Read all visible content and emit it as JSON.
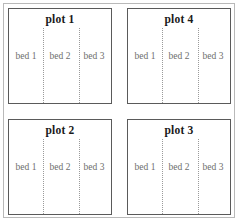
{
  "diagram": {
    "type": "garden-plot-layout",
    "grid": {
      "rows": 2,
      "columns": 2
    },
    "plots": [
      {
        "id": "plot-1",
        "position": "top-left",
        "title": "plot 1",
        "beds": [
          "bed 1",
          "bed 2",
          "bed 3"
        ]
      },
      {
        "id": "plot-4",
        "position": "top-right",
        "title": "plot 4",
        "beds": [
          "bed 1",
          "bed 2",
          "bed 3"
        ]
      },
      {
        "id": "plot-2",
        "position": "bottom-left",
        "title": "plot 2",
        "beds": [
          "bed 1",
          "bed 2",
          "bed 3"
        ]
      },
      {
        "id": "plot-3",
        "position": "bottom-right",
        "title": "plot 3",
        "beds": [
          "bed 1",
          "bed 2",
          "bed 3"
        ]
      }
    ],
    "colors": {
      "outer_frame": "#b9b9b9",
      "plot_border": "#5a5a5a",
      "divider": "#9a9a9a",
      "title_text": "#1a1a1a",
      "bed_text": "#6e6e6e",
      "background": "#ffffff"
    }
  }
}
